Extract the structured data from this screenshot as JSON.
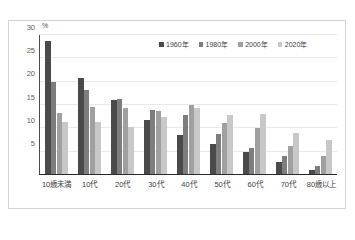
{
  "chart_data": {
    "type": "bar",
    "title": "",
    "xlabel": "",
    "ylabel": "%",
    "unit_label": "%",
    "ylim": [
      0,
      30
    ],
    "yticks": [
      5,
      10,
      15,
      20,
      25,
      30
    ],
    "ytick_labels": [
      "5",
      "10",
      "15",
      "20",
      "25",
      "30"
    ],
    "grid": true,
    "legend_position": "top-right",
    "categories": [
      "10歳未満",
      "10代",
      "20代",
      "30代",
      "40代",
      "50代",
      "60代",
      "70代",
      "80歳以上"
    ],
    "series": [
      {
        "name": "1960年",
        "color": "#4a4a4a",
        "values": [
          28.8,
          20.7,
          16.0,
          11.7,
          8.3,
          6.3,
          4.7,
          2.6,
          0.8
        ]
      },
      {
        "name": "1980年",
        "color": "#7d7d7d",
        "values": [
          19.8,
          18.0,
          16.1,
          13.8,
          12.7,
          8.6,
          5.6,
          3.7,
          1.7
        ]
      },
      {
        "name": "2000年",
        "color": "#a0a0a0",
        "values": [
          13.0,
          14.5,
          14.2,
          13.6,
          14.8,
          11.0,
          9.8,
          6.0,
          3.7
        ]
      },
      {
        "name": "2020年",
        "color": "#c8c8c8",
        "values": [
          11.2,
          11.2,
          10.1,
          12.3,
          14.2,
          12.6,
          12.9,
          8.8,
          7.3
        ]
      }
    ]
  },
  "caption": ""
}
